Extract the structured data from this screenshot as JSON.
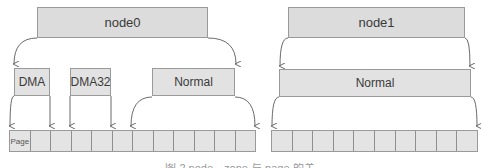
{
  "nodes": [
    {
      "label": "node0",
      "zones": [
        "DMA",
        "DMA32",
        "Normal"
      ]
    },
    {
      "label": "node1",
      "zones": [
        "Normal"
      ]
    }
  ],
  "pages": {
    "first_cell_label": "Page",
    "node0_cell_count": 12,
    "node1_cell_count": 10
  },
  "caption": "图 2 node、zone 与 page 的关系图",
  "colors": {
    "box_fill": "#e2e2e2",
    "border": "#9a9a9a",
    "arrow": "#6a6a6a",
    "text": "#3a3a3a"
  }
}
